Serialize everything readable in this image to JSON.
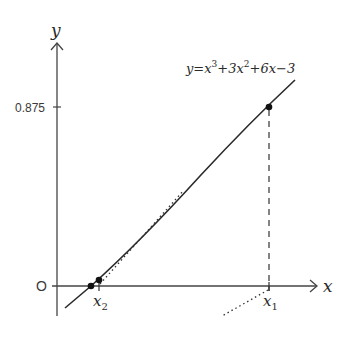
{
  "diagram": {
    "type": "function-graph-newton-method",
    "equation": {
      "prefix": "y=x",
      "exp1": "3",
      "mid1": "+3x",
      "exp2": "2",
      "suffix": "+6x−3"
    },
    "axes": {
      "x_label": "x",
      "y_label": "y",
      "origin_label": "O"
    },
    "y_ticks": [
      {
        "label": "0.875"
      }
    ],
    "x_markers": [
      {
        "label": "x",
        "subscript": "1"
      },
      {
        "label": "x",
        "subscript": "2"
      }
    ],
    "colors": {
      "line": "#2a2a2a",
      "background": "#ffffff"
    }
  }
}
